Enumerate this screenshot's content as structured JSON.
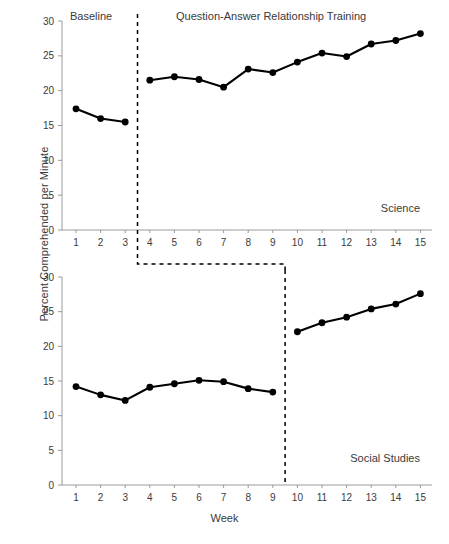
{
  "figure": {
    "ylabel": "Percent Comprehended per Minute",
    "xlabel": "Week"
  },
  "chart_data": [
    {
      "type": "line",
      "panel": "top",
      "title": "Science",
      "xlabel": "Week",
      "ylabel": "Percent Comprehended per Minute",
      "xlim": [
        1,
        15
      ],
      "ylim": [
        0,
        30
      ],
      "yticks": [
        0,
        5,
        10,
        15,
        20,
        25,
        30
      ],
      "xticks": [
        1,
        2,
        3,
        4,
        5,
        6,
        7,
        8,
        9,
        10,
        11,
        12,
        13,
        14,
        15
      ],
      "grid": false,
      "legend": "none",
      "phase_labels": [
        "Baseline",
        "Question-Answer Relationship Training"
      ],
      "phase_change_after_x": 3,
      "series": [
        {
          "name": "Baseline",
          "x": [
            1,
            2,
            3
          ],
          "values": [
            17.4,
            16.0,
            15.5
          ]
        },
        {
          "name": "Question-Answer Relationship Training",
          "x": [
            4,
            5,
            6,
            7,
            8,
            9,
            10,
            11,
            12,
            13,
            14,
            15
          ],
          "values": [
            21.5,
            22.0,
            21.6,
            20.5,
            23.1,
            22.6,
            24.1,
            25.4,
            24.9,
            26.7,
            27.2,
            28.2
          ]
        }
      ]
    },
    {
      "type": "line",
      "panel": "bottom",
      "title": "Social Studies",
      "xlabel": "Week",
      "ylabel": "Percent Comprehended per Minute",
      "xlim": [
        1,
        15
      ],
      "ylim": [
        0,
        30
      ],
      "yticks": [
        0,
        5,
        10,
        15,
        20,
        25,
        30
      ],
      "xticks": [
        1,
        2,
        3,
        4,
        5,
        6,
        7,
        8,
        9,
        10,
        11,
        12,
        13,
        14,
        15
      ],
      "grid": false,
      "legend": "none",
      "phase_labels": [
        "Baseline",
        "Question-Answer Relationship Training"
      ],
      "phase_change_after_x": 9,
      "series": [
        {
          "name": "Baseline",
          "x": [
            1,
            2,
            3,
            4,
            5,
            6,
            7,
            8,
            9
          ],
          "values": [
            14.2,
            13.0,
            12.2,
            14.1,
            14.6,
            15.1,
            14.9,
            13.9,
            13.4
          ]
        },
        {
          "name": "Question-Answer Relationship Training",
          "x": [
            10,
            11,
            12,
            13,
            14,
            15
          ],
          "values": [
            22.1,
            23.4,
            24.2,
            25.4,
            26.1,
            27.6
          ]
        }
      ]
    }
  ],
  "annotations": {
    "top_phase_baseline": "Baseline",
    "top_phase_training": "Question-Answer Relationship Training",
    "top_condition": "Science",
    "bottom_condition": "Social Studies"
  },
  "colors": {
    "line": "#000000",
    "marker": "#000000",
    "axis": "#9a9a9a",
    "text": "#3a3a3a",
    "background": "#ffffff"
  }
}
